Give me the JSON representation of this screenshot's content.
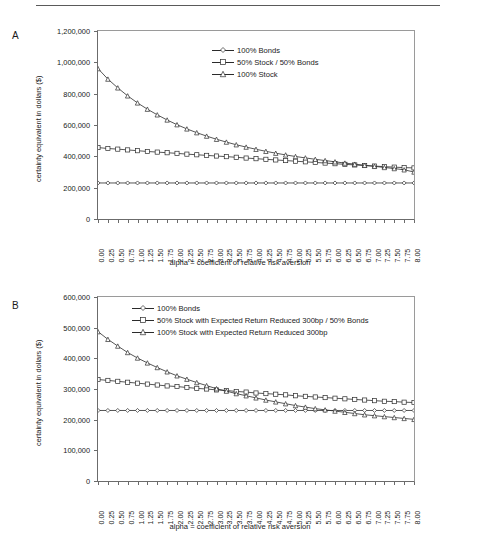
{
  "figure": {
    "panels": [
      {
        "id": "A",
        "label": "A",
        "ylabel": "certainty equivalent in dollars ($)",
        "xlabel": "alpha = coefficient of relative risk aversion"
      },
      {
        "id": "B",
        "label": "B",
        "ylabel": "certainty equivalent in dollars ($)",
        "xlabel": "alpha = coefficient of relative risk aversion"
      }
    ]
  },
  "chart_data": [
    {
      "type": "line",
      "panel": "A",
      "title": "",
      "xlabel": "alpha = coefficient of relative risk aversion",
      "ylabel": "certainty equivalent in dollars ($)",
      "xlim": [
        0,
        8
      ],
      "ylim": [
        0,
        1200000
      ],
      "yticks": [
        0,
        200000,
        400000,
        600000,
        800000,
        1000000,
        1200000
      ],
      "ytick_labels": [
        "0",
        "200,000",
        "400,000",
        "600,000",
        "800,000",
        "1,000,000",
        "1,200,000"
      ],
      "x": [
        0.0,
        0.25,
        0.5,
        0.75,
        1.0,
        1.25,
        1.5,
        1.75,
        2.0,
        2.25,
        2.5,
        2.75,
        3.0,
        3.25,
        3.5,
        3.75,
        4.0,
        4.25,
        4.5,
        4.75,
        5.0,
        5.25,
        5.5,
        5.75,
        6.0,
        6.25,
        6.5,
        6.75,
        7.0,
        7.25,
        7.5,
        7.75,
        8.0
      ],
      "xtick_labels": [
        "0.00",
        "0.25",
        "0.50",
        "0.75",
        "1.00",
        "1.25",
        "1.50",
        "1.75",
        "2.00",
        "2.25",
        "2.50",
        "2.75",
        "3.00",
        "3.25",
        "3.50",
        "3.75",
        "4.00",
        "4.25",
        "4.50",
        "4.75",
        "5.00",
        "5.25",
        "5.50",
        "5.75",
        "6.00",
        "6.25",
        "6.50",
        "6.75",
        "7.00",
        "7.25",
        "7.50",
        "7.75",
        "8.00"
      ],
      "grid": false,
      "legend_position": "upper-right",
      "series": [
        {
          "name": "100% Bonds",
          "marker": "diamond",
          "color": "#2b2b2b",
          "values": [
            230000,
            230000,
            230000,
            230000,
            230000,
            230000,
            230000,
            230000,
            230000,
            230000,
            230000,
            230000,
            230000,
            230000,
            230000,
            230000,
            230000,
            230000,
            230000,
            230000,
            230000,
            230000,
            230000,
            230000,
            230000,
            230000,
            230000,
            230000,
            230000,
            230000,
            230000,
            230000,
            230000
          ]
        },
        {
          "name": "50% Stock / 50% Bonds",
          "marker": "square",
          "color": "#2b2b2b",
          "values": [
            456000,
            450000,
            446000,
            441000,
            436000,
            431000,
            427000,
            423000,
            419000,
            414000,
            410000,
            406000,
            402000,
            398000,
            394000,
            389000,
            385000,
            381000,
            377000,
            373000,
            369000,
            365000,
            361000,
            357000,
            353000,
            349000,
            345000,
            341000,
            338000,
            334000,
            331000,
            328000,
            326000
          ]
        },
        {
          "name": "100% Stock",
          "marker": "triangle",
          "color": "#2b2b2b",
          "values": [
            960000,
            893000,
            837000,
            786000,
            741000,
            701000,
            665000,
            632000,
            602000,
            575000,
            551000,
            529000,
            509000,
            491000,
            474000,
            459000,
            445000,
            432000,
            420000,
            409000,
            399000,
            390000,
            381000,
            373000,
            365000,
            357000,
            350000,
            343000,
            336000,
            329000,
            322000,
            314000,
            300000
          ]
        }
      ]
    },
    {
      "type": "line",
      "panel": "B",
      "title": "",
      "xlabel": "alpha = coefficient of relative risk aversion",
      "ylabel": "certainty equivalent in dollars ($)",
      "xlim": [
        0,
        8
      ],
      "ylim": [
        0,
        600000
      ],
      "yticks": [
        0,
        100000,
        200000,
        300000,
        400000,
        500000,
        600000
      ],
      "ytick_labels": [
        "0",
        "100,000",
        "200,000",
        "300,000",
        "400,000",
        "500,000",
        "600,000"
      ],
      "x": [
        0.0,
        0.25,
        0.5,
        0.75,
        1.0,
        1.25,
        1.5,
        1.75,
        2.0,
        2.25,
        2.5,
        2.75,
        3.0,
        3.25,
        3.5,
        3.75,
        4.0,
        4.25,
        4.5,
        4.75,
        5.0,
        5.25,
        5.5,
        5.75,
        6.0,
        6.25,
        6.5,
        6.75,
        7.0,
        7.25,
        7.5,
        7.75,
        8.0
      ],
      "xtick_labels": [
        "0.00",
        "0.25",
        "0.50",
        "0.75",
        "1.00",
        "1.25",
        "1.50",
        "1.75",
        "2.00",
        "2.25",
        "2.50",
        "2.75",
        "3.00",
        "3.25",
        "3.50",
        "3.75",
        "4.00",
        "4.25",
        "4.50",
        "4.75",
        "5.00",
        "5.25",
        "5.50",
        "5.75",
        "6.00",
        "6.25",
        "6.50",
        "6.75",
        "7.00",
        "7.25",
        "7.50",
        "7.75",
        "8.00"
      ],
      "grid": false,
      "legend_position": "upper-center",
      "series": [
        {
          "name": "100% Bonds",
          "marker": "diamond",
          "color": "#2b2b2b",
          "values": [
            230000,
            230000,
            230000,
            230000,
            230000,
            230000,
            230000,
            230000,
            230000,
            230000,
            230000,
            230000,
            230000,
            230000,
            230000,
            230000,
            230000,
            230000,
            230000,
            230000,
            230000,
            230000,
            230000,
            230000,
            230000,
            230000,
            230000,
            230000,
            230000,
            230000,
            230000,
            230000,
            230000
          ]
        },
        {
          "name": "50% Stock with Expected Return Reduced 300bp / 50% Bonds",
          "marker": "square",
          "color": "#2b2b2b",
          "values": [
            331000,
            328000,
            325000,
            322000,
            319000,
            316000,
            313000,
            310000,
            308000,
            305000,
            302000,
            300000,
            297000,
            295000,
            292000,
            290000,
            287000,
            285000,
            283000,
            281000,
            278000,
            276000,
            274000,
            272000,
            270000,
            268000,
            266000,
            264000,
            262000,
            260000,
            259000,
            257000,
            256000
          ]
        },
        {
          "name": "100% Stock with Expected Return Reduced 300bp",
          "marker": "triangle",
          "color": "#2b2b2b",
          "values": [
            487000,
            462000,
            440000,
            419000,
            401000,
            385000,
            370000,
            356000,
            343000,
            332000,
            321000,
            311000,
            301000,
            293000,
            285000,
            278000,
            271000,
            264000,
            258000,
            252000,
            246000,
            241000,
            236000,
            232000,
            228000,
            224000,
            220000,
            216000,
            213000,
            210000,
            207000,
            204000,
            201000
          ]
        }
      ]
    }
  ]
}
